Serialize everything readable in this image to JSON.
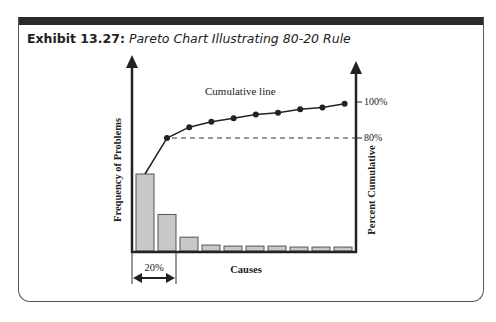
{
  "exhibit": {
    "label": "Exhibit 13.27:",
    "title": "Pareto Chart Illustrating 80-20 Rule"
  },
  "colors": {
    "bar_fill": "#c8c8c8",
    "bar_stroke": "#555555",
    "line": "#222222",
    "header_bar": "#2a2a28"
  },
  "chart_data": {
    "type": "bar",
    "title": "Pareto Chart Illustrating 80-20 Rule",
    "xlabel": "Causes",
    "ylabel": "Frequency of Problems",
    "y2label": "Percent Cumulative",
    "categories": [
      "C1",
      "C2",
      "C3",
      "C4",
      "C5",
      "C6",
      "C7",
      "C8",
      "C9",
      "C10"
    ],
    "values": [
      78,
      37,
      14,
      6,
      5,
      5,
      5,
      4,
      4,
      4
    ],
    "series": [
      {
        "name": "Frequency",
        "type": "bar",
        "values": [
          78,
          37,
          14,
          6,
          5,
          5,
          5,
          4,
          4,
          4
        ]
      },
      {
        "name": "Cumulative line",
        "type": "line",
        "axis": "right",
        "values": [
          null,
          80,
          86,
          89,
          91,
          93,
          94,
          96,
          97,
          99
        ]
      }
    ],
    "y2_ticks": [
      "80%",
      "100%"
    ],
    "annotations": [
      {
        "text": "Cumulative line",
        "target": "line"
      },
      {
        "text": "20%",
        "target": "first two causes span"
      },
      {
        "text": "80% reference dashed line"
      }
    ],
    "grid": false,
    "legend": "none"
  },
  "labels": {
    "cumulative_line": "Cumulative line",
    "pct100": "100%",
    "pct80": "80%",
    "span": "20%",
    "xaxis": "Causes",
    "yaxis_left": "Frequency of Problems",
    "yaxis_right": "Percent Cumulative"
  }
}
